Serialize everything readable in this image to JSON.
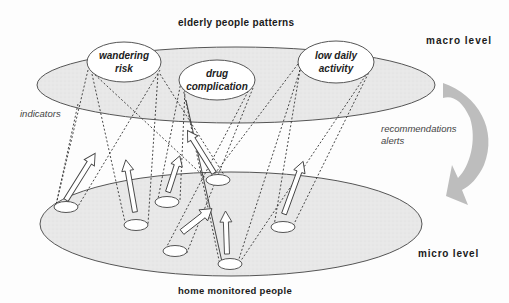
{
  "diagram": {
    "title_top": "elderly people patterns",
    "title_bottom": "home monitored people",
    "levels": {
      "macro": "macro level",
      "micro": "micro level"
    },
    "annotations": {
      "indicators": "indicators",
      "feedback_line1": "recommendations",
      "feedback_line2": "alerts"
    },
    "patterns": [
      {
        "line1": "wandering",
        "line2": "risk"
      },
      {
        "line1": "drug",
        "line2": "complication"
      },
      {
        "line1": "low daily",
        "line2": "activity"
      }
    ],
    "colors": {
      "ellipse_fill": "#e6e6e6",
      "ellipse_stroke": "#555555",
      "pattern_fill": "#ffffff",
      "feedback_arrow": "#b4b4b4",
      "dotted_line": "#333333"
    },
    "people_count": 7
  }
}
